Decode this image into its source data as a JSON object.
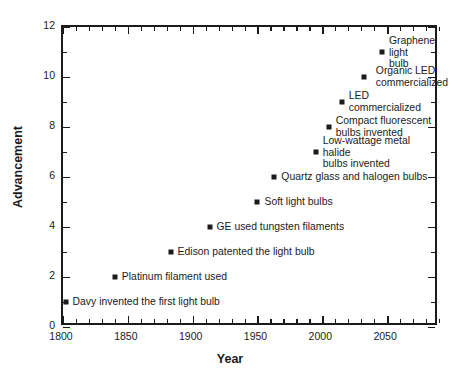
{
  "chart_data": {
    "type": "scatter",
    "title": "",
    "xlabel": "Year",
    "ylabel": "Advancement",
    "xlim": [
      1800,
      2090
    ],
    "ylim": [
      0,
      12
    ],
    "grid": false,
    "legend": "none",
    "xticks": [
      1800,
      1850,
      1900,
      1950,
      2000,
      2050
    ],
    "xtick_labels": [
      "1800",
      "1850",
      "1900",
      "1950",
      "2000",
      "2050"
    ],
    "xtick_minor_step": 10,
    "yticks": [
      0,
      2,
      4,
      6,
      8,
      10,
      12
    ],
    "ytick_labels": [
      "0",
      "2",
      "4",
      "6",
      "8",
      "10",
      "12"
    ],
    "ytick_minor_step": 1,
    "marker_style": "square",
    "marker_color": "#1b1b1b",
    "points": [
      {
        "x": 1802,
        "y": 1,
        "label": "Davy invented the first light bulb",
        "label_align": "left",
        "label_offset_x": 7,
        "label_offset_y": 0
      },
      {
        "x": 1840,
        "y": 2,
        "label": "Platinum filament used",
        "label_align": "left",
        "label_offset_x": 7,
        "label_offset_y": 0
      },
      {
        "x": 1883,
        "y": 3,
        "label": "Edison patented the light bulb",
        "label_align": "left",
        "label_offset_x": 7,
        "label_offset_y": 0
      },
      {
        "x": 1913,
        "y": 4,
        "label": "GE used tungsten filaments",
        "label_align": "left",
        "label_offset_x": 7,
        "label_offset_y": 0
      },
      {
        "x": 1950,
        "y": 5,
        "label": "Soft light bulbs",
        "label_align": "left",
        "label_offset_x": 7,
        "label_offset_y": 0
      },
      {
        "x": 1963,
        "y": 6,
        "label": "Quartz glass and halogen bulbs",
        "label_align": "left",
        "label_offset_x": 7,
        "label_offset_y": 0
      },
      {
        "x": 1995,
        "y": 7,
        "label": "Low-wattage metal halide\nbulbs invented",
        "label_align": "left",
        "label_offset_x": 7,
        "label_offset_y": 0
      },
      {
        "x": 2005,
        "y": 8,
        "label": "Compact fluorescent\nbulbs invented",
        "label_align": "left",
        "label_offset_x": 7,
        "label_offset_y": 0
      },
      {
        "x": 2015,
        "y": 9,
        "label": "LED commercialized",
        "label_align": "left",
        "label_offset_x": 7,
        "label_offset_y": 0
      },
      {
        "x": 2032,
        "y": 10,
        "label": "Organic LED\ncommercialized",
        "label_align": "left",
        "label_offset_x": 12,
        "label_offset_y": 0
      },
      {
        "x": 2046,
        "y": 11,
        "label": "Graphene light\nbulb",
        "label_align": "left",
        "label_offset_x": 7,
        "label_offset_y": 0
      }
    ]
  }
}
